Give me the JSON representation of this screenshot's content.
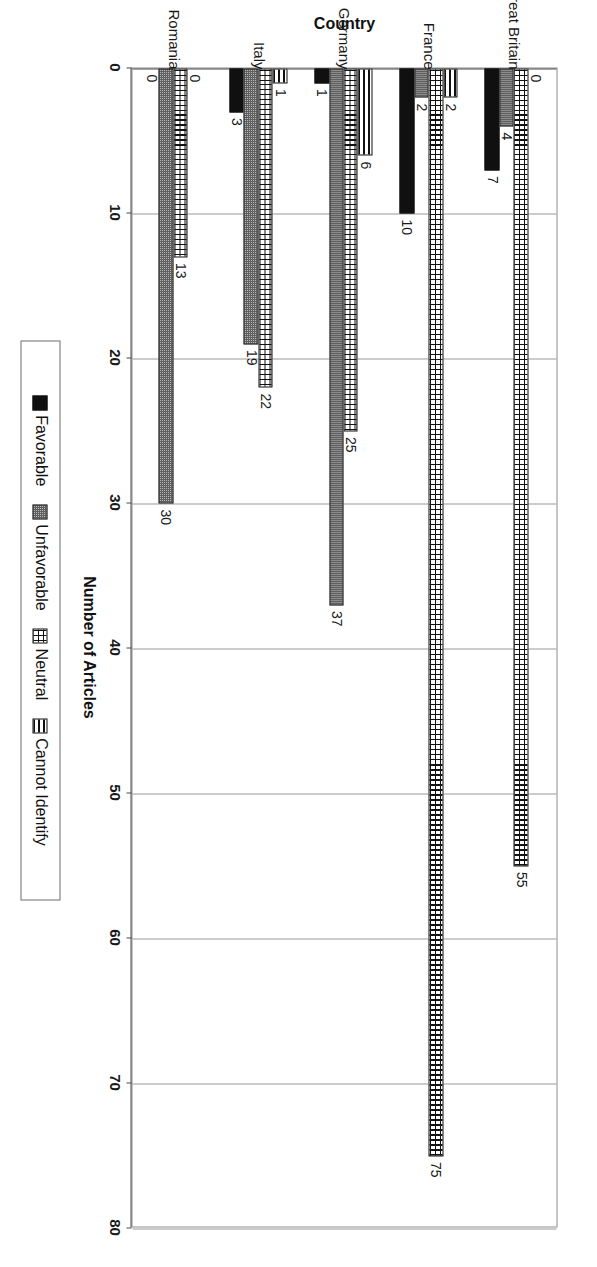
{
  "chart_data": {
    "type": "bar",
    "orientation": "horizontal",
    "title": "",
    "xlabel": "Number of Articles",
    "ylabel": "Country",
    "xlim": [
      0,
      80
    ],
    "xticks": [
      0,
      10,
      20,
      30,
      40,
      50,
      60,
      70,
      80
    ],
    "grid": true,
    "legend_position": "bottom",
    "categories": [
      "Great Britain",
      "France",
      "Germany",
      "Italy",
      "Romania"
    ],
    "series": [
      {
        "name": "Favorable",
        "color": "#101010",
        "pattern": "solid-black",
        "values": [
          7,
          10,
          1,
          3,
          0
        ]
      },
      {
        "name": "Unfavorable",
        "color": "#b9b9b9",
        "pattern": "fine-dots-gray",
        "values": [
          4,
          2,
          37,
          19,
          30
        ]
      },
      {
        "name": "Neutral",
        "color": "#ffffff",
        "pattern": "cross-hatch-grid",
        "values": [
          55,
          75,
          25,
          22,
          13
        ]
      },
      {
        "name": "Cannot Identify",
        "color": "#ffffff",
        "pattern": "horizontal-lines",
        "values": [
          0,
          2,
          6,
          1,
          0
        ]
      }
    ],
    "data_labels": {
      "Great Britain": {
        "Favorable": "7",
        "Unfavorable": "4",
        "Neutral": "55",
        "Cannot Identify": "0"
      },
      "France": {
        "Favorable": "10",
        "Unfavorable": "2",
        "Neutral": "75",
        "Cannot Identify": "2"
      },
      "Germany": {
        "Favorable": "1",
        "Unfavorable": "37",
        "Neutral": "25",
        "Cannot Identify": "6"
      },
      "Italy": {
        "Favorable": "3",
        "Unfavorable": "19",
        "Neutral": "22",
        "Cannot Identify": "1"
      },
      "Romania": {
        "Favorable": "0",
        "Unfavorable": "30",
        "Neutral": "13",
        "Cannot Identify": "0"
      }
    }
  },
  "axes": {
    "value_axis_title": "Number of Articles",
    "category_axis_title": "Country",
    "value_ticks": [
      "0",
      "10",
      "20",
      "30",
      "40",
      "50",
      "60",
      "70",
      "80"
    ],
    "category_ticks": [
      "Great Britain",
      "France",
      "Germany",
      "Italy",
      "Romania"
    ]
  },
  "legend": {
    "items": [
      {
        "label": "Favorable"
      },
      {
        "label": "Unfavorable"
      },
      {
        "label": "Neutral"
      },
      {
        "label": "Cannot Identify"
      }
    ]
  }
}
